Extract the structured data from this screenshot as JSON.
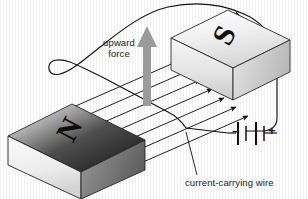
{
  "diagram": {
    "background_color": "#ffffff",
    "ink_color": "#1b1b1b",
    "force_arrow_color": "#9a9a9a"
  },
  "labels": {
    "upward_force": "upward\nforce",
    "upward_force_line1": "upward",
    "upward_force_line2": "force",
    "current_carrying_wire": "current-carrying wire"
  },
  "magnets": [
    {
      "id": "south-magnet",
      "pole": "S",
      "position": "upper-right",
      "face_shade_top": "#f4f4f4",
      "face_shade_front": "#e9e9e9",
      "face_shade_side": "#cfcfcf"
    },
    {
      "id": "north-magnet",
      "pole": "N",
      "position": "lower-left",
      "face_shade_top": "#3a3a3a",
      "face_shade_front": "#dedede",
      "face_shade_side": "#9c9c9c"
    }
  ],
  "battery": {
    "name": "battery",
    "negative_terminal": "−",
    "positive_terminal": "+",
    "cells": 2,
    "plate_count": 4
  },
  "field": {
    "name": "magnetic-field-lines",
    "line_count": 7,
    "direction": "from N pole to S pole",
    "arrowheads_per_line": 1
  },
  "circuit": {
    "name": "current-loop",
    "current_direction_arrow": "clockwise at top-right"
  }
}
